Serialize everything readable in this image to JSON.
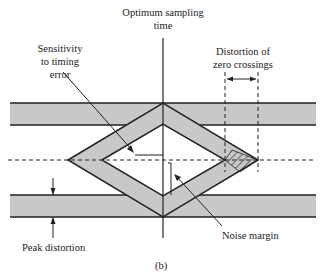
{
  "diagram": {
    "type": "eye-diagram",
    "labels": {
      "optimum_sampling_line1": "Optimum sampling",
      "optimum_sampling_line2": "time",
      "sensitivity_line1": "Sensitivity",
      "sensitivity_line2": "to timing",
      "sensitivity_line3": "error",
      "distortion_line1": "Distortion of",
      "distortion_line2": "zero crossings",
      "noise_margin": "Noise margin",
      "peak_distortion": "Peak distortion",
      "caption": "(b)"
    },
    "colors": {
      "band_fill": "#c8c8c8",
      "line": "#222222"
    }
  }
}
